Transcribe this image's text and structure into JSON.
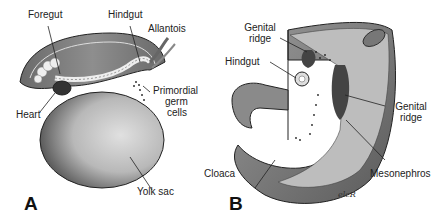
{
  "figure": {
    "panels": [
      {
        "letter": "A",
        "subject": "embryo with yolk sac",
        "labels": {
          "foregut": "Foregut",
          "hindgut": "Hindgut",
          "allantois": "Allantois",
          "primordial_germ_cells_1": "Primordial",
          "primordial_germ_cells_2": "germ",
          "primordial_germ_cells_3": "cells",
          "heart": "Heart",
          "yolk_sac": "Yolk sac"
        }
      },
      {
        "letter": "B",
        "subject": "cutaway of posterior embryo",
        "labels": {
          "genital_ridge_top_1": "Genital",
          "genital_ridge_top_2": "ridge",
          "hindgut": "Hindgut",
          "genital_ridge_right_1": "Genital",
          "genital_ridge_right_2": "ridge",
          "cloaca": "Cloaca",
          "mesonephros": "Mesonephros"
        },
        "signature": "elcR"
      }
    ],
    "colors": {
      "line": "#222222",
      "dark_tissue": "#555555",
      "mid_tissue": "#8a8a8a",
      "light_tissue": "#c8c8c8",
      "background": "#ffffff"
    }
  }
}
